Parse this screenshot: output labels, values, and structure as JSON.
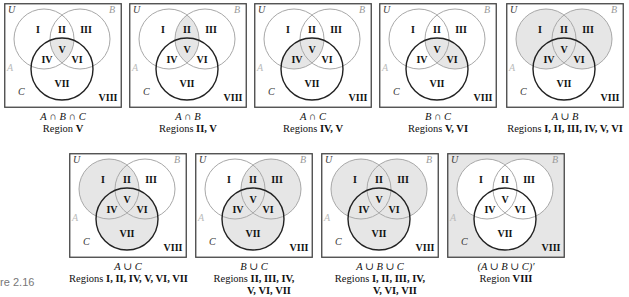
{
  "figure": {
    "label": "ure 2.16",
    "colors": {
      "shade": "#e6e6e6",
      "circle_ab": "#a8a8a8",
      "circle_c": "#222222",
      "frame": "#444444"
    },
    "set_labels": {
      "universe": "U",
      "a": "A",
      "b": "B",
      "c": "C"
    },
    "region_labels": [
      "I",
      "II",
      "III",
      "IV",
      "V",
      "VI",
      "VII",
      "VIII"
    ],
    "panels": [
      {
        "id": "p1",
        "expression": "A ∩ B ∩ C",
        "prefix": "Region ",
        "regions_text": "V",
        "shaded": [
          "V"
        ]
      },
      {
        "id": "p2",
        "expression": "A ∩ B",
        "prefix": "Regions ",
        "regions_text": "II, V",
        "shaded": [
          "II",
          "V"
        ]
      },
      {
        "id": "p3",
        "expression": "A ∩ C",
        "prefix": "Regions ",
        "regions_text": "IV, V",
        "shaded": [
          "IV",
          "V"
        ]
      },
      {
        "id": "p4",
        "expression": "B ∩ C",
        "prefix": "Regions ",
        "regions_text": "V, VI",
        "shaded": [
          "V",
          "VI"
        ]
      },
      {
        "id": "p5",
        "expression": "A ∪ B",
        "prefix": "Regions ",
        "regions_text": "I, II, III, IV, V, VI",
        "shaded": [
          "I",
          "II",
          "III",
          "IV",
          "V",
          "VI"
        ]
      },
      {
        "id": "p6",
        "expression": "A ∪ C",
        "prefix": "Regions ",
        "regions_text": "I, II, IV, V, VI, VII",
        "shaded": [
          "I",
          "II",
          "IV",
          "V",
          "VI",
          "VII"
        ]
      },
      {
        "id": "p7",
        "expression": "B ∪ C",
        "prefix": "Regions ",
        "regions_text": "II, III, IV,",
        "regions_text2": "V, VI, VII",
        "shaded": [
          "II",
          "III",
          "IV",
          "V",
          "VI",
          "VII"
        ]
      },
      {
        "id": "p8",
        "expression": "A ∪ B ∪ C",
        "prefix": "Regions ",
        "regions_text": "I, II, III, IV,",
        "regions_text2": "V, VI, VII",
        "shaded": [
          "I",
          "II",
          "III",
          "IV",
          "V",
          "VI",
          "VII"
        ]
      },
      {
        "id": "p9",
        "expression": "(A ∪ B ∪ C)′",
        "prefix": "Region ",
        "regions_text": "VIII",
        "shaded": [
          "VIII"
        ]
      }
    ]
  }
}
